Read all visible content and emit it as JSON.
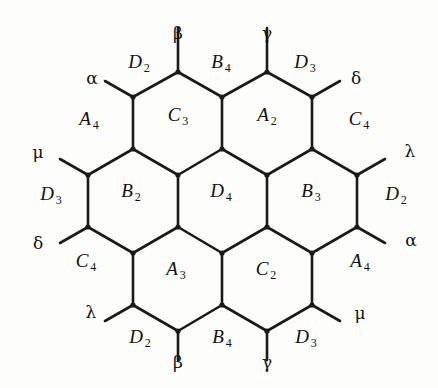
{
  "figure": {
    "kind": "hexagonal-lattice-diagram",
    "title": "",
    "background_color": "#fdfdfb",
    "ink_color": "#1a1a1a"
  },
  "cells": [
    {
      "id": "cell-c3",
      "letter": "C",
      "subscript": "3",
      "x": 178,
      "y": 116
    },
    {
      "id": "cell-a2",
      "letter": "A",
      "subscript": "2",
      "x": 267,
      "y": 116
    },
    {
      "id": "cell-b2",
      "letter": "B",
      "subscript": "2",
      "x": 131,
      "y": 192
    },
    {
      "id": "cell-d4",
      "letter": "D",
      "subscript": "4",
      "x": 221,
      "y": 192
    },
    {
      "id": "cell-b3",
      "letter": "B",
      "subscript": "3",
      "x": 311,
      "y": 192
    },
    {
      "id": "cell-a3",
      "letter": "A",
      "subscript": "3",
      "x": 176,
      "y": 270
    },
    {
      "id": "cell-c2",
      "letter": "C",
      "subscript": "2",
      "x": 266,
      "y": 270
    }
  ],
  "edge_labels": [
    {
      "id": "edge-top-left",
      "letter": "D",
      "subscript": "2",
      "x": 139,
      "y": 63
    },
    {
      "id": "edge-top-middle",
      "letter": "B",
      "subscript": "4",
      "x": 221,
      "y": 63
    },
    {
      "id": "edge-top-right",
      "letter": "D",
      "subscript": "3",
      "x": 305,
      "y": 63
    },
    {
      "id": "edge-upper-left",
      "letter": "A",
      "subscript": "4",
      "x": 89,
      "y": 120
    },
    {
      "id": "edge-upper-right",
      "letter": "C",
      "subscript": "4",
      "x": 359,
      "y": 120
    },
    {
      "id": "edge-mid-left",
      "letter": "D",
      "subscript": "3",
      "x": 51,
      "y": 195
    },
    {
      "id": "edge-mid-right",
      "letter": "D",
      "subscript": "2",
      "x": 396,
      "y": 195
    },
    {
      "id": "edge-lower-left",
      "letter": "C",
      "subscript": "4",
      "x": 86,
      "y": 262
    },
    {
      "id": "edge-lower-right",
      "letter": "A",
      "subscript": "4",
      "x": 360,
      "y": 262
    },
    {
      "id": "edge-bottom-left",
      "letter": "D",
      "subscript": "2",
      "x": 140,
      "y": 338
    },
    {
      "id": "edge-bottom-middle",
      "letter": "B",
      "subscript": "4",
      "x": 222,
      "y": 338
    },
    {
      "id": "edge-bottom-right",
      "letter": "D",
      "subscript": "3",
      "x": 306,
      "y": 338
    }
  ],
  "greek_labels": [
    {
      "id": "greek-top-beta",
      "symbol": "β",
      "x": 178,
      "y": 33
    },
    {
      "id": "greek-top-gamma",
      "symbol": "γ",
      "x": 267,
      "y": 33
    },
    {
      "id": "greek-top-left-alpha",
      "symbol": "α",
      "x": 92,
      "y": 78
    },
    {
      "id": "greek-top-right-delta",
      "symbol": "δ",
      "x": 356,
      "y": 78
    },
    {
      "id": "greek-left-mu",
      "symbol": "μ",
      "x": 38,
      "y": 152
    },
    {
      "id": "greek-right-lambda",
      "symbol": "λ",
      "x": 410,
      "y": 151
    },
    {
      "id": "greek-left-delta",
      "symbol": "δ",
      "x": 38,
      "y": 243
    },
    {
      "id": "greek-right-alpha",
      "symbol": "α",
      "x": 411,
      "y": 240
    },
    {
      "id": "greek-bottom-left-lambda",
      "symbol": "λ",
      "x": 91,
      "y": 312
    },
    {
      "id": "greek-bottom-right-mu",
      "symbol": "μ",
      "x": 360,
      "y": 313
    },
    {
      "id": "greek-bottom-beta",
      "symbol": "β",
      "x": 178,
      "y": 362
    },
    {
      "id": "greek-bottom-gamma",
      "symbol": "γ",
      "x": 267,
      "y": 362
    }
  ],
  "geometry": {
    "note": "pointy-top hexagons, 3 rows: 2 / 3 / 2 cells",
    "edges": [
      [
        178,
        72,
        222,
        97
      ],
      [
        222,
        97,
        267,
        72
      ],
      [
        222,
        97,
        222,
        149
      ],
      [
        133,
        97,
        178,
        72
      ],
      [
        133,
        97,
        133,
        149
      ],
      [
        267,
        72,
        312,
        97
      ],
      [
        312,
        97,
        312,
        149
      ],
      [
        133,
        149,
        178,
        175
      ],
      [
        178,
        175,
        222,
        149
      ],
      [
        222,
        149,
        267,
        175
      ],
      [
        267,
        175,
        312,
        149
      ],
      [
        88,
        175,
        133,
        149
      ],
      [
        88,
        175,
        88,
        227
      ],
      [
        312,
        149,
        357,
        175
      ],
      [
        357,
        175,
        357,
        227
      ],
      [
        178,
        175,
        178,
        227
      ],
      [
        267,
        175,
        267,
        227
      ],
      [
        88,
        227,
        133,
        253
      ],
      [
        133,
        253,
        178,
        227
      ],
      [
        178,
        227,
        222,
        253
      ],
      [
        222,
        253,
        267,
        227
      ],
      [
        267,
        227,
        312,
        253
      ],
      [
        312,
        253,
        357,
        227
      ],
      [
        133,
        253,
        133,
        305
      ],
      [
        222,
        253,
        222,
        305
      ],
      [
        312,
        253,
        312,
        305
      ],
      [
        133,
        305,
        178,
        331
      ],
      [
        178,
        331,
        222,
        305
      ],
      [
        222,
        305,
        267,
        331
      ],
      [
        267,
        331,
        312,
        305
      ]
    ],
    "stubs": [
      [
        178,
        72,
        178,
        28
      ],
      [
        267,
        72,
        267,
        28
      ],
      [
        133,
        97,
        105,
        81
      ],
      [
        312,
        97,
        340,
        81
      ],
      [
        88,
        175,
        60,
        159
      ],
      [
        357,
        175,
        385,
        159
      ],
      [
        88,
        227,
        60,
        243
      ],
      [
        357,
        227,
        385,
        243
      ],
      [
        133,
        305,
        105,
        321
      ],
      [
        312,
        305,
        340,
        321
      ],
      [
        178,
        331,
        178,
        360
      ],
      [
        267,
        331,
        267,
        360
      ]
    ],
    "nodes": [
      [
        178,
        72
      ],
      [
        267,
        72
      ],
      [
        133,
        97
      ],
      [
        222,
        97
      ],
      [
        312,
        97
      ],
      [
        133,
        149
      ],
      [
        222,
        149
      ],
      [
        312,
        149
      ],
      [
        88,
        175
      ],
      [
        178,
        175
      ],
      [
        267,
        175
      ],
      [
        357,
        175
      ],
      [
        88,
        227
      ],
      [
        178,
        227
      ],
      [
        267,
        227
      ],
      [
        357,
        227
      ],
      [
        133,
        253
      ],
      [
        222,
        253
      ],
      [
        312,
        253
      ],
      [
        133,
        305
      ],
      [
        222,
        305
      ],
      [
        312,
        305
      ],
      [
        178,
        331
      ],
      [
        267,
        331
      ]
    ]
  }
}
